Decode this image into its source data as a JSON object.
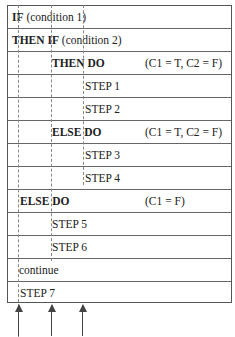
{
  "rows": [
    {
      "indent": 0,
      "keyword": "IF",
      "text": " (condition 1)",
      "note": ""
    },
    {
      "indent": 0,
      "keyword": "THEN IF",
      "text": " (condition 2)",
      "note": ""
    },
    {
      "indent": 1,
      "keyword": "THEN DO",
      "text": "",
      "note": "(C1 = T, C2 = F)"
    },
    {
      "indent": 2,
      "keyword": "",
      "text": "STEP 1",
      "note": ""
    },
    {
      "indent": 2,
      "keyword": "",
      "text": "STEP 2",
      "note": ""
    },
    {
      "indent": 1,
      "keyword": "ELSE DO",
      "text": "",
      "note": "(C1 = T, C2 = F)"
    },
    {
      "indent": 2,
      "keyword": "",
      "text": "STEP 3",
      "note": ""
    },
    {
      "indent": 2,
      "keyword": "",
      "text": "STEP 4",
      "note": ""
    },
    {
      "indent": 0,
      "keyword": "ELSE DO",
      "text": "",
      "note": "(C1 = F)"
    },
    {
      "indent": 1,
      "keyword": "",
      "text": "STEP 5",
      "note": ""
    },
    {
      "indent": 1,
      "keyword": "",
      "text": "STEP 6",
      "note": ""
    },
    {
      "indent": 0,
      "keyword": "",
      "text": "continue",
      "note": ""
    },
    {
      "indent": 0,
      "keyword": "",
      "text": "STEP 7",
      "note": ""
    }
  ],
  "indent_guides": [
    "level-1",
    "level-2",
    "level-3"
  ],
  "arrows": [
    "level-1-arrow",
    "level-2-arrow",
    "level-3-arrow"
  ]
}
